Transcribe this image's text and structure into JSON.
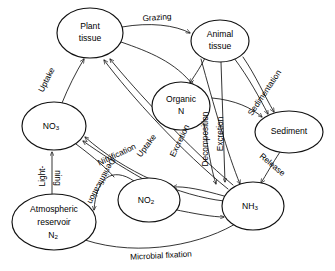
{
  "diagram": {
    "type": "cycle-flow-diagram",
    "background_color": "#ffffff",
    "line_color": "#111111",
    "text_color": "#000000",
    "nodes": [
      {
        "id": "plant-tissue",
        "line1": "Plant",
        "line2": "tissue",
        "line3": "",
        "cx": 90,
        "cy": 33,
        "rx": 33,
        "ry": 25
      },
      {
        "id": "animal-tissue",
        "line1": "Animal",
        "line2": "tissue",
        "line3": "",
        "cx": 220,
        "cy": 41,
        "rx": 29,
        "ry": 21
      },
      {
        "id": "organic-n",
        "line1": "Organic",
        "line2": "N",
        "line3": "",
        "cx": 181,
        "cy": 106,
        "rx": 29,
        "ry": 24
      },
      {
        "id": "sediment",
        "line1": "Sediment",
        "line2": "",
        "line3": "",
        "cx": 289,
        "cy": 132,
        "rx": 34,
        "ry": 21
      },
      {
        "id": "no3",
        "line1": "NO",
        "line2": "",
        "line3": "",
        "sub": "3",
        "cx": 54,
        "cy": 126,
        "rx": 32,
        "ry": 24
      },
      {
        "id": "no2",
        "line1": "NO",
        "line2": "",
        "line3": "",
        "sub": "2",
        "cx": 149,
        "cy": 200,
        "rx": 31,
        "ry": 22
      },
      {
        "id": "nh3",
        "line1": "NH",
        "line2": "",
        "line3": "",
        "sub": "3",
        "cx": 253,
        "cy": 206,
        "rx": 31,
        "ry": 24
      },
      {
        "id": "atmospheric-reservoir",
        "line1": "Atmospheric",
        "line2": "reservoir",
        "line3": "N",
        "sub": "2",
        "cx": 54,
        "cy": 222,
        "rx": 42,
        "ry": 28
      }
    ],
    "edge_labels": [
      {
        "id": "grazing",
        "text": "Grazing",
        "x": 157,
        "y": 18,
        "rotate": -4
      },
      {
        "id": "uptake-left",
        "text": "Uptake",
        "x": 47,
        "y": 80,
        "rotate": -63
      },
      {
        "id": "uptake-center",
        "text": "Uptake",
        "x": 147,
        "y": 146,
        "rotate": -53
      },
      {
        "id": "nitrification",
        "text": "Nitrification",
        "x": 117,
        "y": 155,
        "rotate": -25
      },
      {
        "id": "denitrification",
        "text": "Denitrification",
        "x": 101,
        "y": 181,
        "rotate": 118
      },
      {
        "id": "lightning-1",
        "text": "Light-",
        "x": 43,
        "y": 176,
        "rotate": -90
      },
      {
        "id": "lightning-2",
        "text": "ning",
        "x": 57,
        "y": 178,
        "rotate": 90
      },
      {
        "id": "microbial-fixation",
        "text": "Microbial fixation",
        "x": 161,
        "y": 256,
        "rotate": -3
      },
      {
        "id": "excretion-left",
        "text": "Excretion",
        "x": 180,
        "y": 141,
        "rotate": -64
      },
      {
        "id": "decomposition",
        "text": "Decomposition",
        "x": 206,
        "y": 139,
        "rotate": -90
      },
      {
        "id": "excretion-right",
        "text": "Excretion",
        "x": 221,
        "y": 134,
        "rotate": -90
      },
      {
        "id": "sedimentation",
        "text": "Sedimentation",
        "x": 265,
        "y": 93,
        "rotate": -56
      },
      {
        "id": "release",
        "text": "Release",
        "x": 272,
        "y": 165,
        "rotate": 40
      }
    ]
  }
}
